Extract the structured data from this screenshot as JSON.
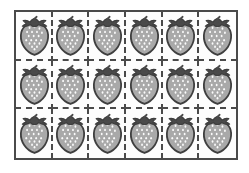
{
  "figure": {
    "type": "array-grid",
    "subject": "strawberry",
    "rows": 3,
    "columns": 6,
    "total_items": 18,
    "frame_border_color": "#4a4a4a",
    "divider_style": "dashed",
    "background_color": "#ffffff",
    "cell_background_color": "#fdfdfd"
  },
  "item": {
    "icon_name": "strawberry-icon",
    "body_color": "#a9a9a9",
    "outline_color": "#3f3f3f",
    "crown_color": "#4a4a4a",
    "seed_color": "#ffffff"
  },
  "grid": {
    "rows": [
      {
        "index": 1,
        "cells": [
          {
            "label": "strawberry"
          },
          {
            "label": "strawberry"
          },
          {
            "label": "strawberry"
          },
          {
            "label": "strawberry"
          },
          {
            "label": "strawberry"
          },
          {
            "label": "strawberry"
          }
        ]
      },
      {
        "index": 2,
        "cells": [
          {
            "label": "strawberry"
          },
          {
            "label": "strawberry"
          },
          {
            "label": "strawberry"
          },
          {
            "label": "strawberry"
          },
          {
            "label": "strawberry"
          },
          {
            "label": "strawberry"
          }
        ]
      },
      {
        "index": 3,
        "cells": [
          {
            "label": "strawberry"
          },
          {
            "label": "strawberry"
          },
          {
            "label": "strawberry"
          },
          {
            "label": "strawberry"
          },
          {
            "label": "strawberry"
          },
          {
            "label": "strawberry"
          }
        ]
      }
    ]
  }
}
